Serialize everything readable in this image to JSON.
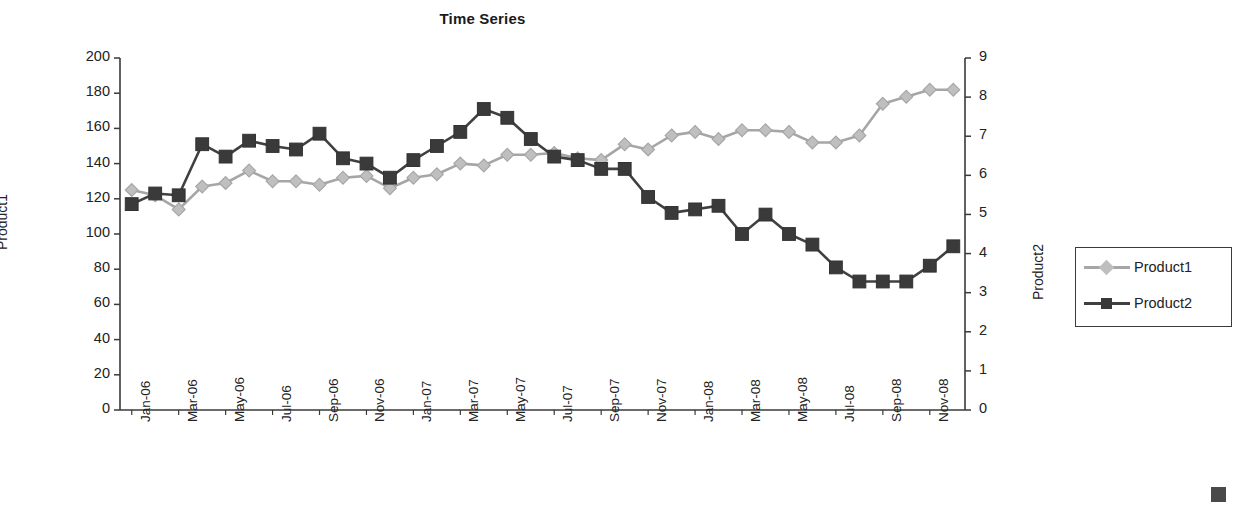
{
  "chart": {
    "title": "Time Series",
    "legend_position": "right"
  },
  "axes": {
    "y_left": {
      "title": "Product1",
      "ticks": [
        "0",
        "20",
        "40",
        "60",
        "80",
        "100",
        "120",
        "140",
        "160",
        "180",
        "200"
      ],
      "min": 0,
      "max": 200,
      "step": 20
    },
    "y_right": {
      "title": "Product2",
      "ticks": [
        "0",
        "1",
        "2",
        "3",
        "4",
        "5",
        "6",
        "7",
        "8",
        "9"
      ],
      "min": 0,
      "max": 9,
      "step": 1
    },
    "x": {
      "ticks": [
        "Jan-06",
        "Mar-06",
        "May-06",
        "Jul-06",
        "Sep-06",
        "Nov-06",
        "Jan-07",
        "Mar-07",
        "May-07",
        "Jul-07",
        "Sep-07",
        "Nov-07",
        "Jan-08",
        "Mar-08",
        "May-08",
        "Jul-08",
        "Sep-08",
        "Nov-08"
      ]
    }
  },
  "legend": {
    "items": [
      {
        "label": "Product1",
        "color": "#a6a6a6",
        "marker": "diamond"
      },
      {
        "label": "Product2",
        "color": "#404040",
        "marker": "square"
      }
    ]
  },
  "chart_data": {
    "type": "line",
    "title": "Time Series",
    "xlabel": "",
    "ylabel": "Product1",
    "y2label": "Product2",
    "ylim": [
      0,
      200
    ],
    "y2lim": [
      0,
      9
    ],
    "grid": false,
    "legend_position": "right",
    "x": [
      "Jan-06",
      "Feb-06",
      "Mar-06",
      "Apr-06",
      "May-06",
      "Jun-06",
      "Jul-06",
      "Aug-06",
      "Sep-06",
      "Oct-06",
      "Nov-06",
      "Dec-06",
      "Jan-07",
      "Feb-07",
      "Mar-07",
      "Apr-07",
      "May-07",
      "Jun-07",
      "Jul-07",
      "Aug-07",
      "Sep-07",
      "Oct-07",
      "Nov-07",
      "Dec-07",
      "Jan-08",
      "Feb-08",
      "Mar-08",
      "Apr-08",
      "May-08",
      "Jun-08",
      "Jul-08",
      "Aug-08",
      "Sep-08",
      "Oct-08",
      "Nov-08",
      "Dec-08"
    ],
    "series": [
      {
        "name": "Product1",
        "axis": "left",
        "color": "#a6a6a6",
        "marker": "diamond",
        "values": [
          125,
          122,
          114,
          127,
          129,
          136,
          130,
          130,
          128,
          132,
          133,
          126,
          132,
          134,
          140,
          139,
          145,
          145,
          146,
          143,
          142,
          151,
          148,
          156,
          158,
          154,
          159,
          159,
          158,
          152,
          152,
          156,
          174,
          178,
          182,
          182
        ]
      },
      {
        "name": "Product2",
        "axis": "right",
        "color": "#404040",
        "marker": "square",
        "values_left_scale": [
          117,
          123,
          122,
          151,
          144,
          153,
          150,
          148,
          157,
          143,
          140,
          132,
          142,
          150,
          158,
          171,
          166,
          154,
          144,
          142,
          137,
          137,
          121,
          112,
          114,
          116,
          100,
          111,
          100,
          94,
          81,
          73,
          73,
          73,
          82,
          93
        ],
        "values": [
          5.27,
          5.54,
          5.49,
          6.8,
          6.48,
          6.89,
          6.75,
          6.66,
          7.07,
          6.44,
          6.3,
          5.94,
          6.39,
          6.75,
          7.11,
          7.7,
          7.47,
          6.93,
          6.48,
          6.39,
          6.17,
          6.17,
          5.45,
          5.04,
          5.13,
          5.22,
          4.5,
          5.0,
          4.5,
          4.23,
          3.65,
          3.29,
          3.29,
          3.29,
          3.69,
          4.19
        ]
      }
    ]
  }
}
